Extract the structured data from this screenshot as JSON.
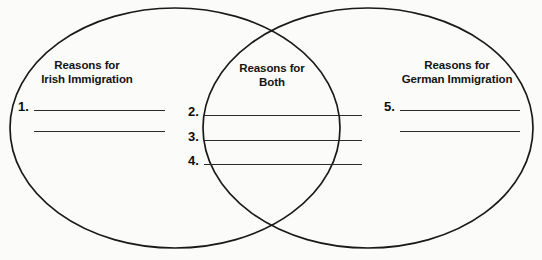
{
  "worksheet": {
    "type": "venn-diagram",
    "shape_count": 2,
    "regions": [
      {
        "id": "left",
        "title_lines": [
          "Reasons for",
          "Irish Immigration"
        ],
        "answers": [
          {
            "number": "1.",
            "value": ""
          },
          {
            "number": "",
            "value": ""
          }
        ]
      },
      {
        "id": "center",
        "title_lines": [
          "Reasons for",
          "Both"
        ],
        "answers": [
          {
            "number": "2.",
            "value": ""
          },
          {
            "number": "3.",
            "value": ""
          },
          {
            "number": "4.",
            "value": ""
          }
        ]
      },
      {
        "id": "right",
        "title_lines": [
          "Reasons for",
          "German Immigration"
        ],
        "answers": [
          {
            "number": "5.",
            "value": ""
          },
          {
            "number": "",
            "value": ""
          }
        ]
      }
    ],
    "colors": {
      "outline": "#1a1a1a",
      "rule": "#2b2b2b",
      "text": "#141414",
      "background": "#fbfbfa"
    }
  }
}
